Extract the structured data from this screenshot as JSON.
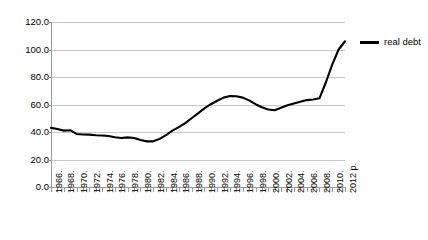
{
  "chart_data": {
    "type": "line",
    "title": "",
    "xlabel": "",
    "ylabel": "",
    "ylim": [
      0.0,
      120.0
    ],
    "ytick_step": 20.0,
    "ytick_labels": [
      "0.0",
      "20.0",
      "40.0",
      "60.0",
      "80.0",
      "100.0",
      "120.0"
    ],
    "grid": true,
    "legend_position": "right",
    "legend": [
      "real debt"
    ],
    "series": [
      {
        "name": "real debt",
        "color": "#000000",
        "x": [
          1966,
          1967,
          1968,
          1969,
          1970,
          1971,
          1972,
          1973,
          1974,
          1975,
          1976,
          1977,
          1978,
          1979,
          1980,
          1981,
          1982,
          1983,
          1984,
          1985,
          1986,
          1987,
          1988,
          1989,
          1990,
          1991,
          1992,
          1993,
          1994,
          1995,
          1996,
          1997,
          1998,
          1999,
          2000,
          2001,
          2002,
          2003,
          2004,
          2005,
          2006,
          2007,
          2008,
          2009,
          2010,
          2011,
          2012
        ],
        "values": [
          43.0,
          42.2,
          41.0,
          41.3,
          38.6,
          38.2,
          38.1,
          37.6,
          37.4,
          37.1,
          36.2,
          35.6,
          36.1,
          35.6,
          34.2,
          33.2,
          33.2,
          35.0,
          37.8,
          41.0,
          43.5,
          46.4,
          50.0,
          53.5,
          57.2,
          60.2,
          62.7,
          65.0,
          66.2,
          66.0,
          65.0,
          63.0,
          60.2,
          58.0,
          56.4,
          55.8,
          57.6,
          59.5,
          60.8,
          62.0,
          63.2,
          63.6,
          64.5,
          76.0,
          89.0,
          100.0,
          106.0
        ]
      }
    ],
    "x_tick_years": [
      1966,
      1967,
      1968,
      1969,
      1970,
      1971,
      1972,
      1973,
      1974,
      1975,
      1976,
      1977,
      1978,
      1979,
      1980,
      1981,
      1982,
      1983,
      1984,
      1985,
      1986,
      1987,
      1988,
      1989,
      1990,
      1991,
      1992,
      1993,
      1994,
      1995,
      1996,
      1997,
      1998,
      1999,
      2000,
      2001,
      2002,
      2003,
      2004,
      2005,
      2006,
      2007,
      2008,
      2009,
      2010,
      2011,
      2012
    ],
    "x_tick_labels": [
      {
        "year": 1966,
        "label": "1966."
      },
      {
        "year": 1968,
        "label": "1968."
      },
      {
        "year": 1970,
        "label": "1970."
      },
      {
        "year": 1972,
        "label": "1972."
      },
      {
        "year": 1974,
        "label": "1974."
      },
      {
        "year": 1976,
        "label": "1976."
      },
      {
        "year": 1978,
        "label": "1978."
      },
      {
        "year": 1980,
        "label": "1980."
      },
      {
        "year": 1982,
        "label": "1982."
      },
      {
        "year": 1984,
        "label": "1984."
      },
      {
        "year": 1986,
        "label": "1986."
      },
      {
        "year": 1988,
        "label": "1988."
      },
      {
        "year": 1990,
        "label": "1990."
      },
      {
        "year": 1992,
        "label": "1992."
      },
      {
        "year": 1994,
        "label": "1994."
      },
      {
        "year": 1996,
        "label": "1996."
      },
      {
        "year": 1998,
        "label": "1998."
      },
      {
        "year": 2000,
        "label": "2000."
      },
      {
        "year": 2002,
        "label": "2002."
      },
      {
        "year": 2004,
        "label": "2004."
      },
      {
        "year": 2006,
        "label": "2006."
      },
      {
        "year": 2008,
        "label": "2008."
      },
      {
        "year": 2010,
        "label": "2010."
      },
      {
        "year": 2012,
        "label": "2012 p."
      }
    ]
  },
  "legend": {
    "series_label": "real debt"
  },
  "colors": {
    "series_line": "#000000",
    "gridline": "#c8c8c8",
    "axis": "#9a9a9a",
    "background": "#ffffff",
    "text": "#000000"
  }
}
